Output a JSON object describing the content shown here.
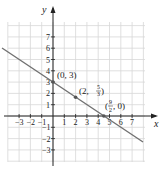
{
  "chart_data": {
    "type": "line",
    "title": "",
    "xlabel": "x",
    "ylabel": "y",
    "xlim": [
      -4,
      8
    ],
    "ylim": [
      -4,
      8
    ],
    "grid": true,
    "x_ticks": [
      -3,
      -2,
      -1,
      1,
      2,
      3,
      4,
      5,
      6,
      7
    ],
    "y_ticks": [
      -3,
      -2,
      -1,
      1,
      2,
      3,
      4,
      5,
      6,
      7
    ],
    "series": [
      {
        "name": "line",
        "equation": "y = -2/3 x + 3",
        "x": [
          -4.5,
          8
        ],
        "y": [
          6,
          -2.3333
        ],
        "color": "#707070"
      }
    ],
    "points": [
      {
        "x": 0,
        "y": 3,
        "label": "(0, 3)"
      },
      {
        "x": 2,
        "y": 1.6667,
        "label": "(2, 5/3)"
      },
      {
        "x": 4.5,
        "y": 0,
        "label": "(9/2, 0)"
      }
    ]
  },
  "labels": {
    "x_axis": "x",
    "y_axis": "y",
    "p1": "(0, 3)",
    "p2_pre": "(2, ",
    "p2_num": "5",
    "p2_den": "3",
    "p2_post": ")",
    "p3_pre": "(",
    "p3_num": "9",
    "p3_den": "2",
    "p3_post": ", 0)"
  },
  "colors": {
    "grid": "#d8d8d8",
    "axis": "#222222",
    "line": "#707070"
  }
}
